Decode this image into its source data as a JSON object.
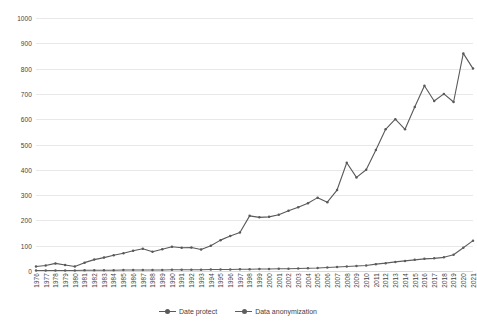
{
  "chart_data": {
    "type": "line",
    "title": "",
    "xlabel": "",
    "ylabel": "",
    "ylim": [
      0,
      1000
    ],
    "y_ticks": [
      0,
      100,
      200,
      300,
      400,
      500,
      600,
      700,
      800,
      900,
      1000
    ],
    "grid": true,
    "legend_position": "bottom",
    "categories": [
      "1976",
      "1977",
      "1978",
      "1979",
      "1980",
      "1981",
      "1982",
      "1983",
      "1984",
      "1985",
      "1986",
      "1987",
      "1988",
      "1989",
      "1990",
      "1991",
      "1992",
      "1993",
      "1994",
      "1995",
      "1996",
      "1997",
      "1998",
      "1999",
      "2000",
      "2001",
      "2002",
      "2003",
      "2004",
      "2005",
      "2006",
      "2007",
      "2008",
      "2009",
      "2010",
      "2011",
      "2012",
      "2013",
      "2014",
      "2015",
      "2016",
      "2017",
      "2018",
      "2019",
      "2020",
      "2021"
    ],
    "series": [
      {
        "name": "Date protect",
        "color": "#595959",
        "values": [
          18,
          22,
          30,
          24,
          18,
          33,
          45,
          53,
          62,
          70,
          80,
          88,
          76,
          86,
          96,
          92,
          93,
          85,
          100,
          122,
          138,
          152,
          218,
          212,
          214,
          222,
          238,
          252,
          268,
          290,
          272,
          320,
          428,
          370,
          400,
          478,
          560,
          600,
          560,
          648,
          732,
          672,
          700,
          668,
          860,
          800
        ]
      },
      {
        "name": "Data anonymization",
        "color": "#5e5e5e",
        "values": [
          2,
          2,
          2,
          2,
          2,
          3,
          3,
          3,
          3,
          4,
          4,
          4,
          4,
          4,
          5,
          5,
          5,
          5,
          6,
          6,
          6,
          7,
          7,
          8,
          8,
          9,
          9,
          10,
          11,
          12,
          14,
          16,
          18,
          20,
          22,
          27,
          31,
          36,
          40,
          44,
          48,
          50,
          54,
          64,
          92,
          120
        ]
      }
    ]
  },
  "axis": {
    "y_labels": [
      "1000",
      "900",
      "800",
      "700",
      "600",
      "500",
      "400",
      "300",
      "200",
      "100",
      "0"
    ]
  },
  "legend": {
    "items": [
      {
        "label": "Date protect"
      },
      {
        "label": "Data anonymization"
      }
    ]
  },
  "colors": {
    "series_1": "#595959",
    "series_2": "#5e5e5e",
    "gridline": "#e8e8e8",
    "text": "#3f3f3f",
    "background": "#ffffff"
  }
}
